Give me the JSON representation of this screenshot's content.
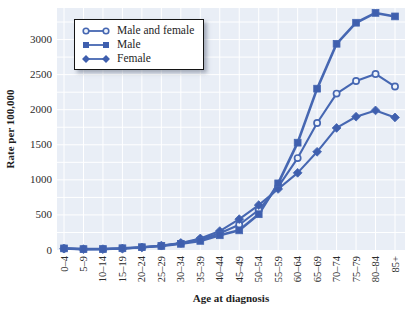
{
  "colors": {
    "line": "#4667b2",
    "marker_fill": "#3f5fae",
    "open_marker_fill": "#f0f5fb",
    "plot_background": "#e9eef6",
    "gridline": "#ffffff",
    "text": "#2b2b2b"
  },
  "legend": {
    "items": [
      {
        "label": "Male and female",
        "marker": "circle-open"
      },
      {
        "label": "Male",
        "marker": "square"
      },
      {
        "label": "Female",
        "marker": "diamond"
      }
    ]
  },
  "chart_data": {
    "type": "line",
    "title": "",
    "xlabel": "Age at diagnosis",
    "ylabel": "Rate per 100,000",
    "categories": [
      "0–4",
      "5–9",
      "10–14",
      "15–19",
      "20–24",
      "25–29",
      "30–34",
      "35–39",
      "40–44",
      "45–49",
      "50–54",
      "55–59",
      "60–64",
      "65–69",
      "70–74",
      "75–79",
      "80–84",
      "85+"
    ],
    "series": [
      {
        "name": "Male and female",
        "marker": "circle-open",
        "values": [
          21,
          12,
          13,
          22,
          38,
          60,
          95,
          150,
          240,
          360,
          570,
          900,
          1310,
          1810,
          2230,
          2410,
          2510,
          2330
        ]
      },
      {
        "name": "Male",
        "marker": "square",
        "values": [
          23,
          13,
          14,
          25,
          40,
          58,
          88,
          130,
          210,
          280,
          510,
          950,
          1530,
          2300,
          2940,
          3240,
          3380,
          3330
        ]
      },
      {
        "name": "Female",
        "marker": "diamond",
        "values": [
          19,
          11,
          12,
          20,
          36,
          62,
          100,
          165,
          270,
          440,
          640,
          870,
          1100,
          1400,
          1740,
          1900,
          1990,
          1890
        ]
      }
    ],
    "ylim": [
      0,
      3450
    ],
    "yticks": [
      0,
      500,
      1000,
      1500,
      2000,
      2500,
      3000
    ],
    "ytick_step_minor": 250,
    "grid": true,
    "legend_position": "top-left"
  }
}
